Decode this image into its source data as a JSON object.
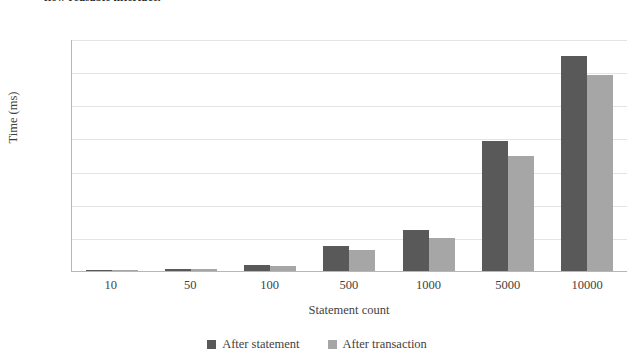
{
  "caption": {
    "text": "flow reusable interface."
  },
  "chart_data": {
    "type": "bar",
    "title": "",
    "categories": [
      "10",
      "50",
      "100",
      "500",
      "1000",
      "5000",
      "10000"
    ],
    "series": [
      {
        "name": "After statement",
        "color": "#595959",
        "values": [
          3,
          15,
          38,
          150,
          248,
          787,
          1300
        ]
      },
      {
        "name": "After transaction",
        "color": "#a6a6a6",
        "values": [
          2,
          13,
          32,
          126,
          202,
          697,
          1180
        ]
      }
    ],
    "xlabel": "Statement count",
    "ylabel": "Time (ms)",
    "ylim": [
      0,
      1400
    ],
    "ytick_step": 200,
    "yticks": [
      "1400",
      "1200",
      "1000",
      "800",
      "600",
      "400",
      "200",
      "0"
    ],
    "grid": true,
    "legend_position": "bottom"
  }
}
